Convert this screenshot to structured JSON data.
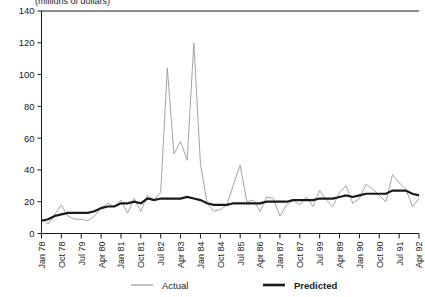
{
  "chart_data": {
    "type": "line",
    "title": "",
    "axis_note": "(millions of dollars)",
    "xlabel": "",
    "ylabel": "",
    "ylim": [
      0,
      140
    ],
    "ytick_labels": [
      "0",
      "20",
      "40",
      "60",
      "80",
      "100",
      "120",
      "140"
    ],
    "ytick_values": [
      0,
      20,
      40,
      60,
      80,
      100,
      120,
      140
    ],
    "grid": false,
    "legend_position": "bottom",
    "xtick_labels": [
      "Jan 78",
      "Oct 78",
      "Jul 79",
      "Apr 80",
      "Jan 81",
      "Oct 81",
      "Jul 82",
      "Apr 83",
      "Jan 84",
      "Oct 84",
      "Jul 85",
      "Apr 86",
      "Jan 87",
      "Oct 87",
      "Jul 99",
      "Apr 89",
      "Jan 90",
      "Oct 90",
      "Jul 91",
      "Apr 92"
    ],
    "xtick_indices": [
      0,
      3,
      6,
      9,
      12,
      15,
      18,
      21,
      24,
      27,
      30,
      33,
      36,
      39,
      42,
      45,
      48,
      51,
      54,
      57
    ],
    "n_points": 58,
    "series": [
      {
        "name": "Actual",
        "color": "#999999",
        "width": 0.9,
        "values": [
          9,
          6,
          12,
          18,
          11,
          9,
          9,
          8,
          11,
          16,
          19,
          17,
          21,
          13,
          22,
          14,
          24,
          21,
          26,
          104,
          50,
          58,
          46,
          120,
          44,
          19,
          14,
          15,
          18,
          31,
          43,
          20,
          21,
          14,
          23,
          22,
          11,
          18,
          21,
          18,
          23,
          17,
          27,
          21,
          17,
          26,
          30,
          19,
          22,
          31,
          28,
          24,
          20,
          37,
          32,
          28,
          17,
          22
        ]
      },
      {
        "name": "Predicted",
        "color": "#1a1a1a",
        "width": 2.2,
        "values": [
          8,
          9,
          11,
          12,
          13,
          13,
          13,
          13,
          14,
          16,
          17,
          17,
          19,
          19,
          20,
          19,
          22,
          21,
          22,
          22,
          22,
          22,
          23,
          22,
          21,
          19,
          18,
          18,
          18,
          19,
          19,
          19,
          19,
          19,
          20,
          20,
          20,
          20,
          21,
          21,
          21,
          21,
          22,
          22,
          22,
          23,
          24,
          23,
          24,
          25,
          25,
          25,
          25,
          27,
          27,
          27,
          25,
          24
        ]
      }
    ],
    "legend": [
      {
        "label": "Actual",
        "color": "#999999",
        "width": 1.2
      },
      {
        "label": "Predicted",
        "color": "#1a1a1a",
        "width": 2.6
      }
    ]
  }
}
